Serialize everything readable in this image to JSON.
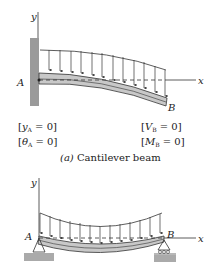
{
  "figure_a": {
    "axis_y": "y",
    "axis_x": "x",
    "point_a": "A",
    "point_b": "B",
    "conditions_left": [
      "[y_A = 0]",
      "[θ_A = 0]"
    ],
    "conditions_right": [
      "[V_B = 0]",
      "[M_B = 0]"
    ],
    "cond_left_1": {
      "open": "[",
      "var": "y",
      "sub": "A",
      "rest": " = 0]"
    },
    "cond_left_2": {
      "open": "[",
      "var": "θ",
      "sub": "A",
      "rest": " = 0]"
    },
    "cond_right_1": {
      "open": "[",
      "var": "V",
      "sub": "B",
      "rest": " = 0]"
    },
    "cond_right_2": {
      "open": "[",
      "var": "M",
      "sub": "B",
      "rest": " = 0]"
    },
    "caption_tag": "(a)",
    "caption_text": " Cantilever beam"
  },
  "figure_b": {
    "axis_y": "y",
    "axis_x": "x",
    "point_a": "A",
    "point_b": "B"
  },
  "colors": {
    "beam_fill": "#c8c8c8",
    "wall_fill": "#9a9a9a",
    "ground_fill": "#aaaaaa",
    "line": "#333333"
  }
}
